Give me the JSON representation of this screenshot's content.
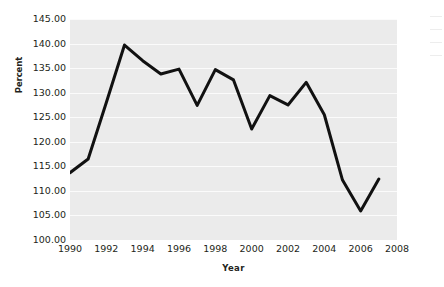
{
  "chart_data": {
    "type": "line",
    "title": "",
    "subtitle": "",
    "xlabel": "Year",
    "ylabel": "Percent",
    "x": [
      1990,
      1991,
      1992,
      1993,
      1994,
      1995,
      1996,
      1997,
      1998,
      1999,
      2000,
      2001,
      2002,
      2003,
      2004,
      2005,
      2006,
      2007
    ],
    "values": [
      113.7,
      116.5,
      128.0,
      139.7,
      136.5,
      133.8,
      134.8,
      127.4,
      134.7,
      132.6,
      122.6,
      129.4,
      127.5,
      132.1,
      125.5,
      112.2,
      105.9,
      112.4
    ],
    "series": [
      {
        "name": "Percent",
        "values": [
          113.7,
          116.5,
          128.0,
          139.7,
          136.5,
          133.8,
          134.8,
          127.4,
          134.7,
          132.6,
          122.6,
          129.4,
          127.5,
          132.1,
          125.5,
          112.2,
          105.9,
          112.4
        ]
      }
    ],
    "xlim": [
      1990,
      2008
    ],
    "ylim": [
      100.0,
      145.0
    ],
    "x_tick_labels": [
      "1990",
      "1992",
      "1994",
      "1996",
      "1998",
      "2000",
      "2002",
      "2004",
      "2006",
      "2008"
    ],
    "x_tick_values": [
      1990,
      1992,
      1994,
      1996,
      1998,
      2000,
      2002,
      2004,
      2006,
      2008
    ],
    "y_tick_labels": [
      "145.00",
      "140.00",
      "135.00",
      "130.00",
      "125.00",
      "120.00",
      "115.00",
      "110.00",
      "105.00",
      "100.00"
    ],
    "y_tick_values": [
      145.0,
      140.0,
      135.0,
      130.0,
      125.0,
      120.0,
      115.0,
      110.0,
      105.0,
      100.0
    ],
    "grid": true,
    "grid_orientation": "horizontal",
    "legend": false,
    "legend_position": "none",
    "line_color": "#111111",
    "line_width": 3,
    "markers": false,
    "plot_background": "#ebebeb",
    "gridline_color": "#fbfbfb",
    "figure_background": "#ffffff",
    "text_color": "#231f20"
  }
}
